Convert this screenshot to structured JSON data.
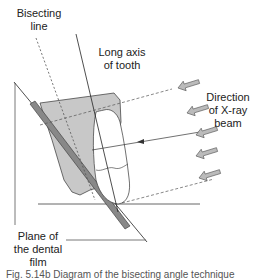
{
  "labels": {
    "bisecting_line_1": "Bisecting",
    "bisecting_line_2": "line",
    "long_axis_1": "Long axis",
    "long_axis_2": "of tooth",
    "xray_1": "Direction",
    "xray_2": "of X-ray",
    "xray_3": "beam",
    "film_1": "Plane of",
    "film_2": "the dental",
    "film_3": "film"
  },
  "caption": "Fig. 5.14b Diagram of the bisecting angle technique",
  "colors": {
    "line": "#222222",
    "shading": "#c8c8c8",
    "film": "#888888",
    "arrow_fill": "#bbbbbb",
    "dashed": "#555555"
  }
}
